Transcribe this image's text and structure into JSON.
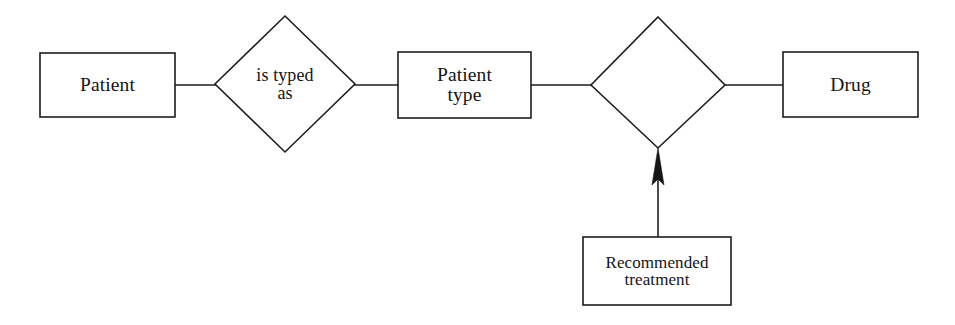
{
  "diagram": {
    "type": "entity-relationship",
    "background_color": "#ffffff",
    "stroke_color": "#1d1d1d",
    "text_color": "#141414",
    "entities": [
      {
        "id": "patient",
        "label": "Patient",
        "shape": "rectangle",
        "x": 40,
        "y": 53,
        "width": 135,
        "height": 64
      },
      {
        "id": "patient-type",
        "label": "Patient\ntype",
        "shape": "rectangle",
        "x": 398,
        "y": 52,
        "width": 133,
        "height": 66
      },
      {
        "id": "drug",
        "label": "Drug",
        "shape": "rectangle",
        "x": 783,
        "y": 52,
        "width": 135,
        "height": 65
      },
      {
        "id": "recommended-treatment",
        "label": "Recommended\ntreatment",
        "shape": "rectangle",
        "x": 583,
        "y": 237,
        "width": 148,
        "height": 68
      }
    ],
    "relationships": [
      {
        "id": "is-typed-as",
        "label": "is typed\nas",
        "shape": "diamond",
        "center_x": 285,
        "center_y": 84,
        "half_width": 70,
        "half_height": 68
      },
      {
        "id": "unlabeled-relationship",
        "label": "",
        "shape": "diamond",
        "center_x": 658,
        "center_y": 85,
        "half_width": 67,
        "half_height": 66
      }
    ],
    "connectors": [
      {
        "id": "patient-to-is-typed-as",
        "from": "patient",
        "to": "is-typed-as",
        "style": "plain-line",
        "points": "175,85 215,85"
      },
      {
        "id": "is-typed-as-to-patient-type",
        "from": "is-typed-as",
        "to": "patient-type",
        "style": "plain-line",
        "points": "355,85 398,85"
      },
      {
        "id": "patient-type-to-relationship",
        "from": "patient-type",
        "to": "unlabeled-relationship",
        "style": "plain-line",
        "points": "531,85 591,85"
      },
      {
        "id": "relationship-to-drug",
        "from": "unlabeled-relationship",
        "to": "drug",
        "style": "plain-line",
        "points": "725,85 783,85"
      },
      {
        "id": "recommended-treatment-to-relationship",
        "from": "recommended-treatment",
        "to": "unlabeled-relationship",
        "style": "arrow-up",
        "points": "658,237 658,148"
      }
    ]
  }
}
